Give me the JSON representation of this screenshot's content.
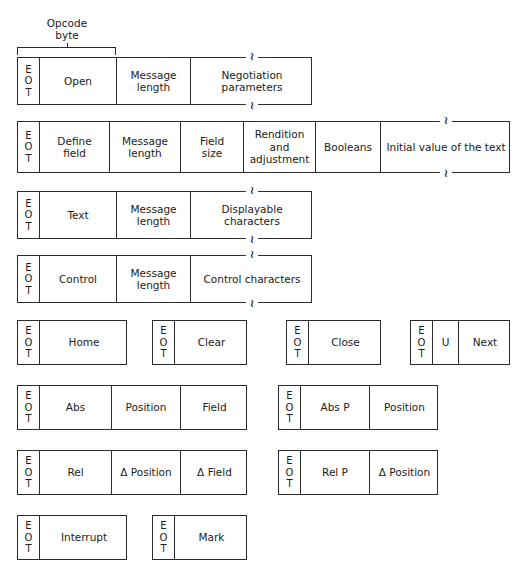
{
  "diagram": {
    "annotation": {
      "label": "Opcode\nbyte"
    },
    "eot_label": {
      "l1": "E",
      "l2": "O",
      "l3": "T"
    },
    "rows": [
      {
        "name": "open-message",
        "x": 17,
        "y": 57,
        "width": 295,
        "height": 48,
        "cells": [
          {
            "name": "eot",
            "text": "",
            "width": 22,
            "eot": true
          },
          {
            "name": "opcode",
            "text": "Open",
            "width": 77
          },
          {
            "name": "message-length",
            "text": "Message\nlength",
            "width": 74
          },
          {
            "name": "payload",
            "text": "Negotiation parameters",
            "width": 122,
            "continued": true
          }
        ]
      },
      {
        "name": "define-field-message",
        "x": 17,
        "y": 121,
        "width": 493,
        "height": 52,
        "cells": [
          {
            "name": "eot",
            "text": "",
            "width": 22,
            "eot": true
          },
          {
            "name": "opcode",
            "text": "Define\nfield",
            "width": 70
          },
          {
            "name": "message-length",
            "text": "Message\nlength",
            "width": 71
          },
          {
            "name": "field-size",
            "text": "Field\nsize",
            "width": 63
          },
          {
            "name": "rendition-adjustment",
            "text": "Rendition\nand\nadjustment",
            "width": 72
          },
          {
            "name": "booleans",
            "text": "Booleans",
            "width": 65
          },
          {
            "name": "payload",
            "text": "Initial value of the text",
            "width": 130,
            "continued": true
          }
        ]
      },
      {
        "name": "text-message",
        "x": 17,
        "y": 191,
        "width": 295,
        "height": 48,
        "cells": [
          {
            "name": "eot",
            "text": "",
            "width": 22,
            "eot": true
          },
          {
            "name": "opcode",
            "text": "Text",
            "width": 77
          },
          {
            "name": "message-length",
            "text": "Message\nlength",
            "width": 74
          },
          {
            "name": "payload",
            "text": "Displayable characters",
            "width": 122,
            "continued": true
          }
        ]
      },
      {
        "name": "control-message",
        "x": 17,
        "y": 255,
        "width": 295,
        "height": 48,
        "cells": [
          {
            "name": "eot",
            "text": "",
            "width": 22,
            "eot": true
          },
          {
            "name": "opcode",
            "text": "Control",
            "width": 77
          },
          {
            "name": "message-length",
            "text": "Message\nlength",
            "width": 74
          },
          {
            "name": "payload",
            "text": "Control characters",
            "width": 122,
            "continued": true
          }
        ]
      },
      {
        "name": "home-message",
        "x": 17,
        "y": 320,
        "width": 110,
        "height": 45,
        "cells": [
          {
            "name": "eot",
            "text": "",
            "width": 22,
            "eot": true
          },
          {
            "name": "opcode",
            "text": "Home",
            "width": 88
          }
        ]
      },
      {
        "name": "clear-message",
        "x": 152,
        "y": 320,
        "width": 95,
        "height": 45,
        "cells": [
          {
            "name": "eot",
            "text": "",
            "width": 22,
            "eot": true
          },
          {
            "name": "opcode",
            "text": "Clear",
            "width": 73
          }
        ]
      },
      {
        "name": "close-message",
        "x": 286,
        "y": 320,
        "width": 95,
        "height": 45,
        "cells": [
          {
            "name": "eot",
            "text": "",
            "width": 22,
            "eot": true
          },
          {
            "name": "opcode",
            "text": "Close",
            "width": 73
          }
        ]
      },
      {
        "name": "next-message",
        "x": 410,
        "y": 320,
        "width": 100,
        "height": 45,
        "cells": [
          {
            "name": "eot",
            "text": "",
            "width": 22,
            "eot": true
          },
          {
            "name": "flag",
            "text": "U",
            "width": 26
          },
          {
            "name": "opcode",
            "text": "Next",
            "width": 52
          }
        ]
      },
      {
        "name": "abs-message",
        "x": 17,
        "y": 385,
        "width": 230,
        "height": 45,
        "cells": [
          {
            "name": "eot",
            "text": "",
            "width": 22,
            "eot": true
          },
          {
            "name": "opcode",
            "text": "Abs",
            "width": 72
          },
          {
            "name": "position",
            "text": "Position",
            "width": 69
          },
          {
            "name": "field",
            "text": "Field",
            "width": 67
          }
        ]
      },
      {
        "name": "abs-p-message",
        "x": 278,
        "y": 385,
        "width": 160,
        "height": 45,
        "cells": [
          {
            "name": "eot",
            "text": "",
            "width": 22,
            "eot": true
          },
          {
            "name": "opcode",
            "text": "Abs P",
            "width": 69
          },
          {
            "name": "position",
            "text": "Position",
            "width": 69
          }
        ]
      },
      {
        "name": "rel-message",
        "x": 17,
        "y": 450,
        "width": 230,
        "height": 45,
        "cells": [
          {
            "name": "eot",
            "text": "",
            "width": 22,
            "eot": true
          },
          {
            "name": "opcode",
            "text": "Rel",
            "width": 72
          },
          {
            "name": "delta-position",
            "text": "Δ Position",
            "width": 69
          },
          {
            "name": "delta-field",
            "text": "Δ Field",
            "width": 67
          }
        ]
      },
      {
        "name": "rel-p-message",
        "x": 278,
        "y": 450,
        "width": 160,
        "height": 45,
        "cells": [
          {
            "name": "eot",
            "text": "",
            "width": 22,
            "eot": true
          },
          {
            "name": "opcode",
            "text": "Rel P",
            "width": 69
          },
          {
            "name": "delta-position",
            "text": "Δ Position",
            "width": 69
          }
        ]
      },
      {
        "name": "interrupt-message",
        "x": 17,
        "y": 515,
        "width": 110,
        "height": 45,
        "cells": [
          {
            "name": "eot",
            "text": "",
            "width": 22,
            "eot": true
          },
          {
            "name": "opcode",
            "text": "Interrupt",
            "width": 88
          }
        ]
      },
      {
        "name": "mark-message",
        "x": 152,
        "y": 515,
        "width": 95,
        "height": 45,
        "cells": [
          {
            "name": "eot",
            "text": "",
            "width": 22,
            "eot": true
          },
          {
            "name": "opcode",
            "text": "Mark",
            "width": 73
          }
        ]
      }
    ],
    "bracket": {
      "x": 17,
      "y": 47,
      "width": 99,
      "height": 8
    },
    "annotation_box": {
      "x": 37,
      "y": 17,
      "width": 60
    }
  }
}
